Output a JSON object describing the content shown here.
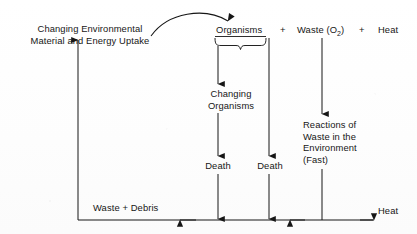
{
  "diagram": {
    "canvas": {
      "width": 417,
      "height": 234
    },
    "ink_color": "#161616",
    "background_color": "#ffffff",
    "nodes": {
      "uptake": "Changing Environmental\nMaterial and Energy Uptake",
      "uptake_line1": "Changing Environmental",
      "uptake_line2": "Material and Energy Uptake",
      "organisms": "Organisms",
      "plus_1": "+",
      "waste_o2_main": "Waste (O",
      "waste_o2_sub": "2",
      "waste_o2_close": ")",
      "plus_2": "+",
      "heat_top": "Heat",
      "changing_organisms_line1": "Changing",
      "changing_organisms_line2": "Organisms",
      "death_left": "Death",
      "death_right": "Death",
      "reactions_line1": "Reactions of",
      "reactions_line2": "Waste in the",
      "reactions_line3": "Environment",
      "reactions_line4": "(Fast)",
      "waste_debris": "Waste + Debris",
      "heat_bottom": "Heat"
    },
    "edges": [
      {
        "name": "curved-feedback-arrow",
        "from": "uptake",
        "to": "organisms",
        "style": "curved"
      },
      {
        "name": "brace-split",
        "from": "organisms",
        "to": "two-branches",
        "style": "curly-brace"
      },
      {
        "name": "organisms-to-changing-organisms",
        "from": "organisms",
        "to": "changing_organisms",
        "style": "straight-down"
      },
      {
        "name": "changing-organisms-to-death",
        "from": "changing_organisms",
        "to": "death_left",
        "style": "straight-down"
      },
      {
        "name": "organisms-to-death-right",
        "from": "organisms",
        "to": "death_right",
        "style": "straight-down"
      },
      {
        "name": "death-left-to-baseline",
        "from": "death_left",
        "to": "baseline",
        "style": "straight-down"
      },
      {
        "name": "death-right-to-baseline",
        "from": "death_right",
        "to": "baseline",
        "style": "straight-down"
      },
      {
        "name": "waste-o2-to-reactions",
        "from": "waste_o2",
        "to": "reactions",
        "style": "straight-down"
      },
      {
        "name": "reactions-to-baseline",
        "from": "reactions",
        "to": "baseline",
        "style": "straight-down"
      },
      {
        "name": "baseline-heat-out",
        "from": "baseline",
        "to": "heat_bottom",
        "style": "straight-right"
      },
      {
        "name": "baseline-leftward-return",
        "from": "baseline",
        "to": "waste_debris",
        "style": "straight-left"
      },
      {
        "name": "baseline-to-uptake",
        "from": "waste_debris",
        "to": "uptake",
        "style": "straight-up"
      }
    ]
  }
}
